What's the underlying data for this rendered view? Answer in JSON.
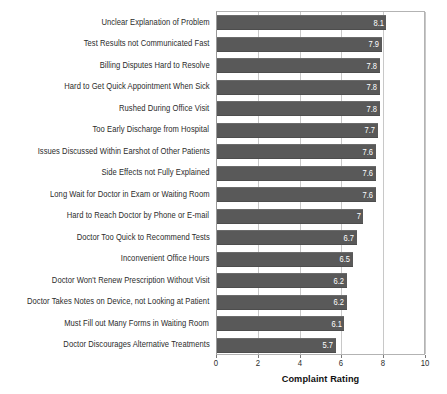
{
  "chart_data": {
    "type": "bar",
    "orientation": "horizontal",
    "title": "",
    "xlabel": "Complaint Rating",
    "ylabel": "",
    "xlim": [
      0,
      10
    ],
    "xticks": [
      "0",
      "2",
      "4",
      "6",
      "8",
      "10"
    ],
    "grid": true,
    "legend": null,
    "bar_color": "#595959",
    "value_label_color": "#ffffff",
    "categories": [
      "Unclear Explanation of Problem",
      "Test Results not Communicated Fast",
      "Billing Disputes Hard to Resolve",
      "Hard to Get Quick Appointment When Sick",
      "Rushed During Office Visit",
      "Too Early Discharge from Hospital",
      "Issues Discussed Within Earshot of Other Patients",
      "Side Effects not Fully Explained",
      "Long Wait for Doctor in Exam or Waiting Room",
      "Hard to Reach Doctor by Phone or E-mail",
      "Doctor Too Quick to Recommend Tests",
      "Inconvenient Office Hours",
      "Doctor Won't Renew Prescription Without Visit",
      "Doctor Takes Notes on Device, not Looking at Patient",
      "Must Fill out Many Forms in Waiting Room",
      "Doctor Discourages Alternative Treatments"
    ],
    "values": [
      8.1,
      7.9,
      7.8,
      7.8,
      7.8,
      7.7,
      7.6,
      7.6,
      7.6,
      7,
      6.7,
      6.5,
      6.2,
      6.2,
      6.1,
      5.7
    ],
    "value_labels": [
      "8.1",
      "7.9",
      "7.8",
      "7.8",
      "7.8",
      "7.7",
      "7.6",
      "7.6",
      "7.6",
      "7",
      "6.7",
      "6.5",
      "6.2",
      "6.2",
      "6.1",
      "5.7"
    ]
  }
}
